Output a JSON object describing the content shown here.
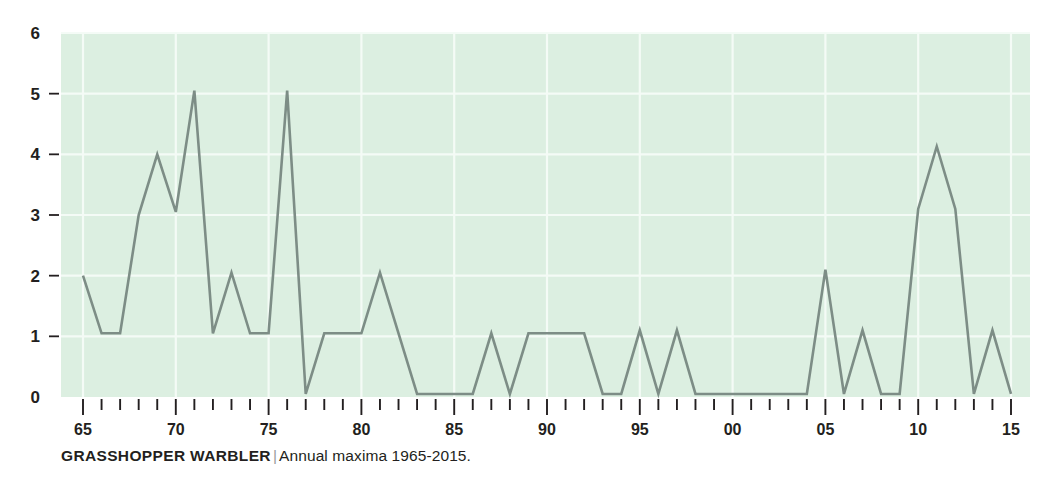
{
  "caption": {
    "title": "GRASSHOPPER WARBLER",
    "separator": "|",
    "subtitle": "Annual maxima 1965-2015."
  },
  "colors": {
    "plot_background": "#dcefe1",
    "gridline": "#f4fbf6",
    "line": "#7d8d86",
    "text": "#231f20",
    "tick": "#231f20",
    "page_background": "#ffffff"
  },
  "chart_data": {
    "type": "line",
    "title": "GRASSHOPPER WARBLER",
    "subtitle": "Annual maxima 1965-2015.",
    "xlabel": "",
    "ylabel": "",
    "ylim": [
      0,
      6
    ],
    "xlim": [
      1965,
      2015
    ],
    "grid": true,
    "legend": false,
    "y_ticks": [
      0,
      1,
      2,
      3,
      4,
      5,
      6
    ],
    "y_tick_labels": [
      "0",
      "1",
      "2",
      "3",
      "4",
      "5",
      "6"
    ],
    "x_tick_labels": [
      {
        "year": 1965,
        "label": "65"
      },
      {
        "year": 1970,
        "label": "70"
      },
      {
        "year": 1975,
        "label": "75"
      },
      {
        "year": 1980,
        "label": "80"
      },
      {
        "year": 1985,
        "label": "85"
      },
      {
        "year": 1990,
        "label": "90"
      },
      {
        "year": 1995,
        "label": "95"
      },
      {
        "year": 2000,
        "label": "00"
      },
      {
        "year": 2005,
        "label": "05"
      },
      {
        "year": 2010,
        "label": "10"
      },
      {
        "year": 2015,
        "label": "15"
      }
    ],
    "x": [
      1965,
      1966,
      1967,
      1968,
      1969,
      1970,
      1971,
      1972,
      1973,
      1974,
      1975,
      1976,
      1977,
      1978,
      1979,
      1980,
      1981,
      1982,
      1983,
      1984,
      1985,
      1986,
      1987,
      1988,
      1989,
      1990,
      1991,
      1992,
      1993,
      1994,
      1995,
      1996,
      1997,
      1998,
      1999,
      2000,
      2001,
      2002,
      2003,
      2004,
      2005,
      2006,
      2007,
      2008,
      2009,
      2010,
      2011,
      2012,
      2013,
      2014,
      2015
    ],
    "values": [
      2.0,
      1.05,
      1.05,
      3.0,
      4.0,
      3.05,
      5.05,
      1.05,
      2.05,
      1.05,
      1.05,
      5.05,
      0.05,
      1.05,
      1.05,
      1.05,
      2.05,
      1.05,
      0.05,
      0.05,
      0.05,
      0.05,
      1.05,
      0.05,
      1.05,
      1.05,
      1.05,
      1.05,
      0.05,
      0.05,
      1.1,
      0.05,
      1.1,
      0.05,
      0.05,
      0.05,
      0.05,
      0.05,
      0.05,
      0.05,
      2.1,
      0.05,
      1.1,
      0.05,
      0.05,
      3.1,
      4.13,
      3.1,
      0.05,
      1.1,
      0.05
    ]
  }
}
